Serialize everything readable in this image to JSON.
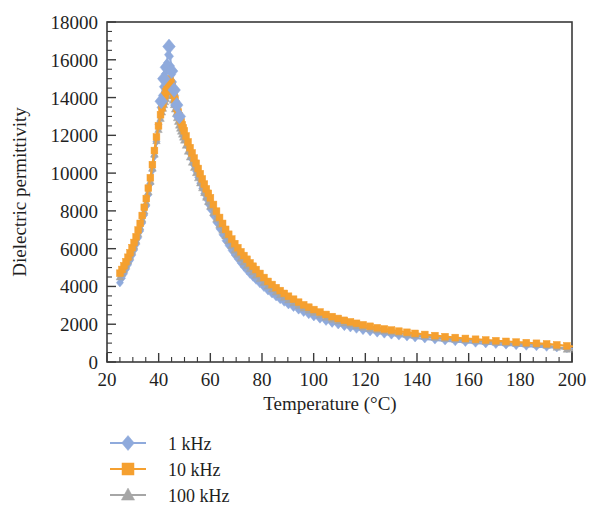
{
  "chart_data": {
    "type": "line",
    "title": "",
    "xlabel": "Temperature (°C)",
    "ylabel": "Dielectric permittivity",
    "xlim": [
      20,
      200
    ],
    "ylim": [
      0,
      18000
    ],
    "xticks": [
      20,
      40,
      60,
      80,
      100,
      120,
      140,
      160,
      180,
      200
    ],
    "yticks": [
      0,
      2000,
      4000,
      6000,
      8000,
      10000,
      12000,
      14000,
      16000,
      18000
    ],
    "xtick_labels": [
      "20",
      "40",
      "60",
      "80",
      "100",
      "120",
      "140",
      "160",
      "180",
      "200"
    ],
    "ytick_labels": [
      "0",
      "2000",
      "4000",
      "6000",
      "8000",
      "10000",
      "12000",
      "14000",
      "16000",
      "18000"
    ],
    "x_minor_per_major": 4,
    "y_minor_per_major": 4,
    "grid": false,
    "legend_position": "below-left",
    "frame": "box",
    "series": [
      {
        "name": "1 kHz",
        "color": "#8faadc",
        "marker": "diamond",
        "x": [
          25,
          27,
          29,
          31,
          33,
          35,
          37,
          39,
          41,
          42,
          43,
          44,
          45,
          46,
          47,
          48,
          49,
          50,
          52,
          54,
          56,
          58,
          60,
          63,
          66,
          69,
          72,
          75,
          78,
          82,
          86,
          90,
          95,
          100,
          106,
          112,
          118,
          125,
          132,
          140,
          150,
          160,
          170,
          180,
          190,
          200
        ],
        "y": [
          4200,
          4800,
          5400,
          6100,
          7000,
          8100,
          9600,
          11500,
          13800,
          15000,
          15600,
          16700,
          15400,
          14400,
          13600,
          13000,
          12500,
          12000,
          11100,
          10300,
          9500,
          8800,
          8100,
          7200,
          6400,
          5750,
          5200,
          4700,
          4300,
          3800,
          3400,
          3050,
          2700,
          2400,
          2100,
          1880,
          1700,
          1530,
          1400,
          1270,
          1130,
          1030,
          940,
          860,
          790,
          700
        ]
      },
      {
        "name": "10 kHz",
        "color": "#f5a030",
        "marker": "square",
        "x": [
          25,
          27,
          29,
          31,
          33,
          35,
          37,
          39,
          41,
          42,
          43,
          44,
          45,
          46,
          47,
          48,
          49,
          50,
          52,
          54,
          56,
          58,
          60,
          63,
          66,
          69,
          72,
          75,
          78,
          82,
          86,
          90,
          95,
          100,
          106,
          112,
          118,
          125,
          132,
          140,
          150,
          160,
          170,
          180,
          190,
          200
        ],
        "y": [
          4700,
          5200,
          5800,
          6500,
          7400,
          8500,
          9900,
          11800,
          13300,
          13900,
          14400,
          15000,
          14700,
          14100,
          13500,
          13000,
          12600,
          12200,
          11400,
          10700,
          10000,
          9300,
          8700,
          7800,
          7000,
          6350,
          5800,
          5300,
          4850,
          4300,
          3880,
          3500,
          3100,
          2780,
          2450,
          2200,
          2000,
          1800,
          1650,
          1500,
          1350,
          1230,
          1130,
          1040,
          960,
          830
        ]
      },
      {
        "name": "100 kHz",
        "color": "#a6a6a6",
        "marker": "triangle",
        "x": [
          25,
          27,
          29,
          31,
          33,
          35,
          37,
          39,
          41,
          42,
          43,
          44,
          45,
          46,
          47,
          48,
          49,
          50,
          52,
          54,
          56,
          58,
          60,
          63,
          66,
          69,
          72,
          75,
          78,
          82,
          86,
          90,
          95,
          100,
          106,
          112,
          118,
          125,
          132,
          140,
          150,
          160,
          170,
          180,
          190,
          200
        ],
        "y": [
          4500,
          5000,
          5600,
          6300,
          7200,
          8300,
          9700,
          11600,
          13100,
          13600,
          14000,
          14500,
          14200,
          13600,
          13000,
          12500,
          12100,
          11700,
          10900,
          10200,
          9500,
          8850,
          8250,
          7400,
          6650,
          6000,
          5450,
          4980,
          4550,
          4050,
          3650,
          3300,
          2920,
          2620,
          2300,
          2060,
          1870,
          1680,
          1540,
          1400,
          1250,
          1140,
          1040,
          960,
          880,
          620
        ]
      }
    ]
  },
  "legend": {
    "items": [
      {
        "label": "1 kHz"
      },
      {
        "label": "10 kHz"
      },
      {
        "label": "100 kHz"
      }
    ]
  }
}
